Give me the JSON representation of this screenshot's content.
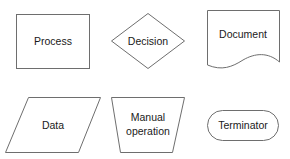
{
  "diagram": {
    "type": "flowchart-legend",
    "stroke_color": "#6e6e6e",
    "fill_color": "#ffffff",
    "text_color": "#1a1a1a",
    "shapes": [
      {
        "id": "process",
        "shape": "rectangle",
        "label": "Process"
      },
      {
        "id": "decision",
        "shape": "diamond",
        "label": "Decision"
      },
      {
        "id": "document",
        "shape": "document",
        "label": "Document"
      },
      {
        "id": "data",
        "shape": "parallelogram",
        "label": "Data"
      },
      {
        "id": "manual-operation",
        "shape": "trapezoid",
        "label_lines": [
          "Manual",
          "operation"
        ]
      },
      {
        "id": "terminator",
        "shape": "rounded-rectangle",
        "label": "Terminator"
      }
    ]
  }
}
